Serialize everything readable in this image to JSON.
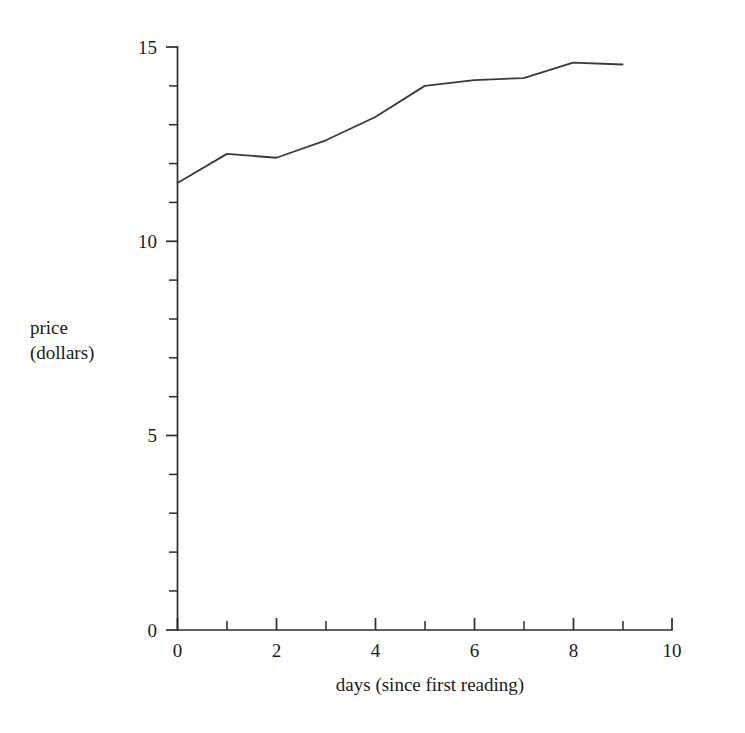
{
  "chart_data": {
    "type": "line",
    "title": "",
    "subtitle": "",
    "xlabel": "days (since first reading)",
    "ylabel": "price\n(dollars)",
    "ylabel_line1": "price",
    "ylabel_line2": "(dollars)",
    "x": [
      0,
      1,
      2,
      3,
      4,
      5,
      6,
      7,
      8,
      9
    ],
    "values": [
      11.5,
      12.25,
      12.15,
      12.6,
      13.2,
      14.0,
      14.15,
      14.2,
      14.6,
      14.55
    ],
    "series": [
      {
        "name": "price",
        "values": [
          11.5,
          12.25,
          12.15,
          12.6,
          13.2,
          14.0,
          14.15,
          14.2,
          14.6,
          14.55
        ]
      }
    ],
    "xlim": [
      0,
      10
    ],
    "ylim": [
      0,
      15
    ],
    "x_major_ticks": [
      0,
      2,
      4,
      6,
      8,
      10
    ],
    "x_minor_ticks": [
      1,
      3,
      5,
      7,
      9
    ],
    "x_tick_labels": [
      "0",
      "2",
      "4",
      "6",
      "8",
      "10"
    ],
    "y_major_ticks": [
      0,
      5,
      10,
      15
    ],
    "y_minor_ticks": [
      1,
      2,
      3,
      4,
      6,
      7,
      8,
      9,
      11,
      12,
      13,
      14
    ],
    "y_tick_labels": [
      "0",
      "5",
      "10",
      "15"
    ],
    "grid": false,
    "legend": false,
    "legend_position": "none",
    "line_color": "#3a3a3a",
    "axis_color": "#2b2b2b",
    "background_color": "#ffffff"
  }
}
